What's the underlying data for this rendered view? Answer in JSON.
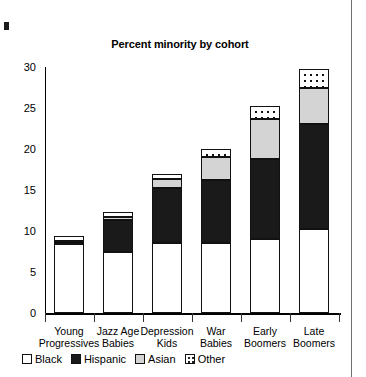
{
  "chart_data": {
    "type": "bar",
    "title": "Percent minority by cohort",
    "xlabel": "",
    "ylabel": "",
    "ylim": [
      0,
      30
    ],
    "yticks": [
      0,
      5,
      10,
      15,
      20,
      25,
      30
    ],
    "grid": false,
    "stacked": true,
    "legend_position": "bottom-left",
    "categories": [
      "Young Progressives",
      "Jazz Age Babies",
      "Depression Kids",
      "War Babies",
      "Early Boomers",
      "Late Boomers"
    ],
    "category_lines": [
      [
        "Young",
        "Progressives"
      ],
      [
        "Jazz Age",
        "Babies"
      ],
      [
        "Depression",
        "Kids"
      ],
      [
        "War",
        "Babies"
      ],
      [
        "Early",
        "Boomers"
      ],
      [
        "Late",
        "Boomers"
      ]
    ],
    "series": [
      {
        "name": "Black",
        "values": [
          8.4,
          7.5,
          8.5,
          8.5,
          9.0,
          10.2
        ]
      },
      {
        "name": "Hispanic",
        "values": [
          0.2,
          3.8,
          6.8,
          7.7,
          9.8,
          12.8
        ]
      },
      {
        "name": "Asian",
        "values": [
          0.2,
          0.4,
          1.1,
          2.8,
          4.9,
          4.5
        ]
      },
      {
        "name": "Other",
        "values": [
          0.6,
          0.6,
          0.6,
          1.0,
          1.5,
          2.3
        ]
      }
    ],
    "totals": [
      9.4,
      12.3,
      17.0,
      20.0,
      25.2,
      29.8
    ]
  },
  "legend": {
    "items": [
      {
        "label": "Black",
        "swatch": "swatch-empty-white"
      },
      {
        "label": "Hispanic",
        "swatch": "swatch-solid-dark"
      },
      {
        "label": "Asian",
        "swatch": "swatch-light-gray"
      },
      {
        "label": "Other",
        "swatch": "swatch-dotted"
      }
    ]
  }
}
